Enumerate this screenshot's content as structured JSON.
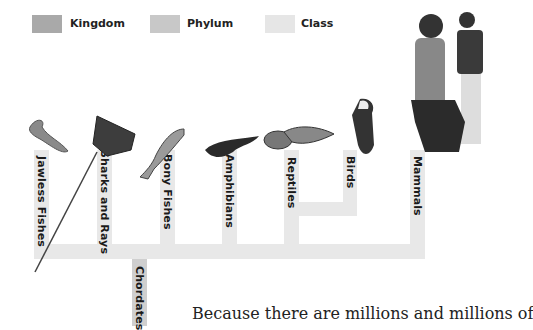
{
  "legend": {
    "items": [
      {
        "label": "Kingdom",
        "color": "#a9a9a9"
      },
      {
        "label": "Phylum",
        "color": "#c8c8c8"
      },
      {
        "label": "Class",
        "color": "#e6e6e6"
      }
    ]
  },
  "tree": {
    "phylum": {
      "label": "Chordates",
      "color": "#cfcfcf"
    },
    "classes": [
      {
        "label": "Jawless Fishes",
        "icon": "lamprey-icon"
      },
      {
        "label": "Sharks and Rays",
        "icon": "stingray-icon"
      },
      {
        "label": "Bony Fishes",
        "icon": "trout-icon"
      },
      {
        "label": "Amphibians",
        "icon": "salamander-icon"
      },
      {
        "label": "Reptiles",
        "icon": "lizard-snake-icon"
      },
      {
        "label": "Birds",
        "icon": "eagle-icon"
      },
      {
        "label": "Mammals",
        "icon": "people-and-dog-icon"
      }
    ],
    "class_color": "#e8e8e8"
  },
  "body_text": "Because there are millions and millions of"
}
